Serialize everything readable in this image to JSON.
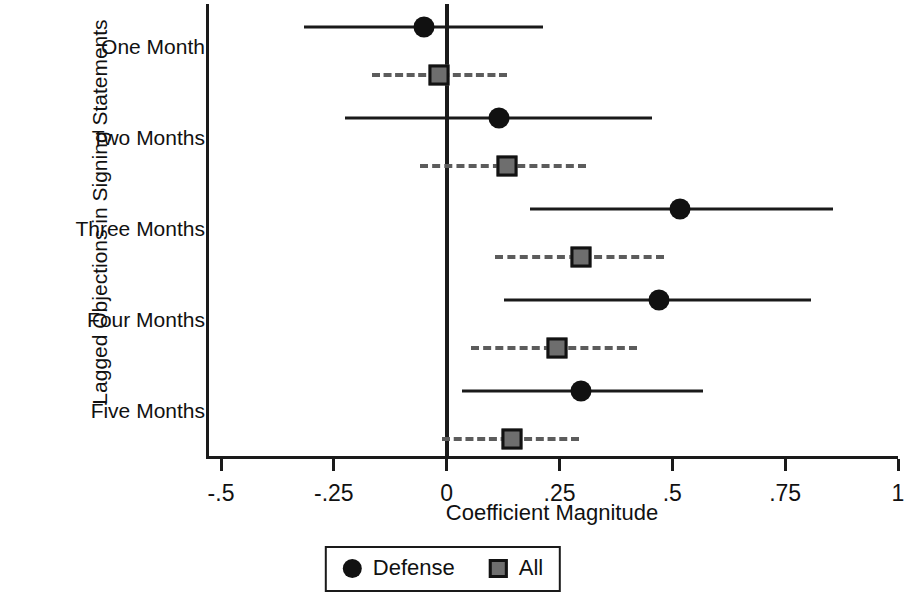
{
  "chart_data": {
    "type": "scatter",
    "subtype": "coefficient-plot-with-confidence-intervals",
    "title": "",
    "xlabel": "Coefficient Magnitude",
    "ylabel": "Lagged Objections in Signing Statements",
    "xlim": [
      -0.5,
      1.0
    ],
    "xticks": [
      -0.5,
      -0.25,
      0,
      0.25,
      0.5,
      0.75,
      1
    ],
    "xticklabels": [
      "-.5",
      "-.25",
      "0",
      ".25",
      ".5",
      ".75",
      "1"
    ],
    "grid": false,
    "reference_line": 0,
    "legend_position": "bottom",
    "categories": [
      "One Month",
      "Two Months",
      "Three Months",
      "Four Months",
      "Five Months"
    ],
    "series": [
      {
        "name": "Defense",
        "marker": "circle",
        "color": "#111111",
        "line_style": "solid",
        "values": [
          -0.05,
          0.117,
          0.518,
          0.47,
          0.297
        ],
        "ci_low": [
          -0.315,
          -0.225,
          0.185,
          0.128,
          0.034
        ],
        "ci_high": [
          0.214,
          0.455,
          0.856,
          0.808,
          0.568
        ]
      },
      {
        "name": "All",
        "marker": "square",
        "color": "#6e6e6e",
        "line_style": "dashed",
        "values": [
          -0.018,
          0.133,
          0.297,
          0.245,
          0.144
        ],
        "ci_low": [
          -0.165,
          -0.058,
          0.106,
          0.054,
          -0.011
        ],
        "ci_high": [
          0.133,
          0.308,
          0.482,
          0.421,
          0.293
        ]
      }
    ]
  },
  "legend": {
    "items": [
      {
        "label": "Defense",
        "marker": "circle-marker-icon"
      },
      {
        "label": "All",
        "marker": "square-marker-icon"
      }
    ]
  }
}
